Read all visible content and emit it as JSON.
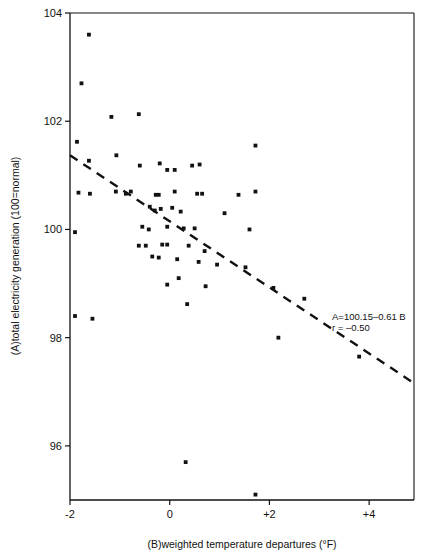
{
  "figure": {
    "top_cropped_caption": "",
    "background_color": "#ffffff",
    "ink_color": "#111111"
  },
  "chart_data": {
    "type": "scatter",
    "title": "",
    "xlabel": "(B)weighted temperature departures (°F)",
    "ylabel": "(A)total electricity generation (100=normal)",
    "xlim": [
      -2,
      4.9
    ],
    "ylim": [
      95.0,
      104
    ],
    "xticks": [
      -2,
      0,
      2,
      4
    ],
    "xtick_labels": [
      "-2",
      "0",
      "+2",
      "+4"
    ],
    "yticks": [
      96,
      98,
      100,
      102,
      104
    ],
    "ytick_labels": [
      "96",
      "98",
      "100",
      "102",
      "104"
    ],
    "grid": false,
    "legend": null,
    "marker": "square-dot",
    "marker_color": "#111111",
    "annotations": [
      {
        "text": "A=100.15–0.61 B",
        "x": 3.05,
        "y": 99.35
      },
      {
        "text": "r = –0.50",
        "x": 3.05,
        "y": 99.15
      }
    ],
    "fit_line": {
      "style": "dashed",
      "equation": "A = 100.15 - 0.61 B",
      "correlation": -0.5,
      "intercept": 100.15,
      "slope": -0.61,
      "x_start": -2.0,
      "y_start": 101.37,
      "x_end": 4.9,
      "y_end": 97.16
    },
    "points": [
      {
        "x": -1.62,
        "y": 103.6
      },
      {
        "x": -1.77,
        "y": 102.7
      },
      {
        "x": -1.17,
        "y": 102.08
      },
      {
        "x": -1.86,
        "y": 101.62
      },
      {
        "x": -1.07,
        "y": 101.37
      },
      {
        "x": -1.62,
        "y": 101.27
      },
      {
        "x": -0.62,
        "y": 102.13
      },
      {
        "x": -0.6,
        "y": 101.18
      },
      {
        "x": -0.2,
        "y": 101.22
      },
      {
        "x": -0.05,
        "y": 101.1
      },
      {
        "x": 0.1,
        "y": 101.1
      },
      {
        "x": 0.45,
        "y": 101.18
      },
      {
        "x": 0.6,
        "y": 101.2
      },
      {
        "x": 1.72,
        "y": 101.55
      },
      {
        "x": -1.83,
        "y": 100.68
      },
      {
        "x": -1.6,
        "y": 100.66
      },
      {
        "x": -1.08,
        "y": 100.7
      },
      {
        "x": -0.88,
        "y": 100.66
      },
      {
        "x": -0.78,
        "y": 100.7
      },
      {
        "x": -0.28,
        "y": 100.64
      },
      {
        "x": -0.22,
        "y": 100.64
      },
      {
        "x": 0.1,
        "y": 100.7
      },
      {
        "x": 0.55,
        "y": 100.66
      },
      {
        "x": 0.65,
        "y": 100.66
      },
      {
        "x": 1.38,
        "y": 100.64
      },
      {
        "x": 1.72,
        "y": 100.7
      },
      {
        "x": -0.4,
        "y": 100.42
      },
      {
        "x": -0.3,
        "y": 100.35
      },
      {
        "x": -0.18,
        "y": 100.38
      },
      {
        "x": 0.05,
        "y": 100.4
      },
      {
        "x": 0.22,
        "y": 100.33
      },
      {
        "x": 1.1,
        "y": 100.3
      },
      {
        "x": -1.9,
        "y": 99.95
      },
      {
        "x": -0.55,
        "y": 100.05
      },
      {
        "x": -0.42,
        "y": 100.0
      },
      {
        "x": -0.05,
        "y": 100.05
      },
      {
        "x": 0.28,
        "y": 100.02
      },
      {
        "x": 0.5,
        "y": 100.02
      },
      {
        "x": 1.6,
        "y": 100.0
      },
      {
        "x": -0.62,
        "y": 99.7
      },
      {
        "x": -0.48,
        "y": 99.7
      },
      {
        "x": -0.15,
        "y": 99.72
      },
      {
        "x": -0.05,
        "y": 99.72
      },
      {
        "x": 0.38,
        "y": 99.7
      },
      {
        "x": 0.7,
        "y": 99.6
      },
      {
        "x": -0.35,
        "y": 99.5
      },
      {
        "x": -0.22,
        "y": 99.48
      },
      {
        "x": 0.15,
        "y": 99.45
      },
      {
        "x": 0.58,
        "y": 99.4
      },
      {
        "x": 0.95,
        "y": 99.35
      },
      {
        "x": 1.52,
        "y": 99.3
      },
      {
        "x": 0.18,
        "y": 99.1
      },
      {
        "x": -1.9,
        "y": 98.4
      },
      {
        "x": -1.55,
        "y": 98.35
      },
      {
        "x": -0.05,
        "y": 98.98
      },
      {
        "x": 0.72,
        "y": 98.95
      },
      {
        "x": 0.35,
        "y": 98.62
      },
      {
        "x": 2.08,
        "y": 98.92
      },
      {
        "x": 2.7,
        "y": 98.72
      },
      {
        "x": 2.18,
        "y": 98.0
      },
      {
        "x": 3.8,
        "y": 97.65
      },
      {
        "x": 0.32,
        "y": 95.7
      },
      {
        "x": 1.72,
        "y": 95.1
      }
    ]
  }
}
